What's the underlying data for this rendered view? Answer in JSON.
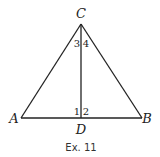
{
  "figure": {
    "caption": "Ex. 11",
    "points": {
      "A": {
        "label": "A",
        "x": 21,
        "y": 118
      },
      "B": {
        "label": "B",
        "x": 142,
        "y": 118
      },
      "C": {
        "label": "C",
        "x": 81,
        "y": 24
      },
      "D": {
        "label": "D",
        "x": 81,
        "y": 118
      }
    },
    "segments": [
      "AC",
      "BC",
      "AB",
      "CD"
    ],
    "angles": {
      "a1": {
        "label": "1",
        "at": "D",
        "side": "left"
      },
      "a2": {
        "label": "2",
        "at": "D",
        "side": "right"
      },
      "a3": {
        "label": "3",
        "at": "C",
        "side": "left"
      },
      "a4": {
        "label": "4",
        "at": "C",
        "side": "right"
      }
    },
    "colors": {
      "line": "#222222",
      "background": "#ffffff"
    }
  }
}
